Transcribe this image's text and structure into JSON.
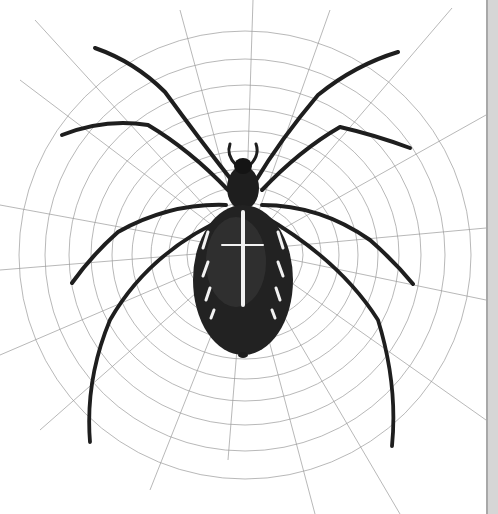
{
  "image": {
    "subject": "Engraved illustration of an orb-weaver spider at the center of its web",
    "alt": "Spider on web illustration",
    "colors": {
      "background": "#ffffff",
      "web": "#9a9a9a",
      "spider_body": "#1e1e1e",
      "spider_markings": "#f2f2f2",
      "right_strip": "#d6d6d6",
      "right_strip_edge": "#a8a8a8"
    }
  }
}
